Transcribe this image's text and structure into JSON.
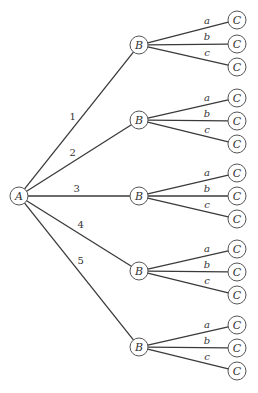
{
  "root": {
    "label": "A",
    "x": 19,
    "y": 196
  },
  "node_radius": 9,
  "level1": {
    "x": 139,
    "nodes": [
      {
        "label": "B",
        "edge_label": "1",
        "y": 45,
        "children_y": [
          20,
          44,
          67
        ]
      },
      {
        "label": "B",
        "edge_label": "2",
        "y": 120,
        "children_y": [
          98,
          121,
          144
        ]
      },
      {
        "label": "B",
        "edge_label": "3",
        "y": 196,
        "children_y": [
          173,
          196,
          219
        ]
      },
      {
        "label": "B",
        "edge_label": "4",
        "y": 271,
        "children_y": [
          249,
          272,
          295
        ]
      },
      {
        "label": "B",
        "edge_label": "5",
        "y": 347,
        "children_y": [
          325,
          348,
          371
        ]
      }
    ]
  },
  "level2": {
    "x": 237,
    "label": "C",
    "edge_labels": [
      "a",
      "b",
      "c"
    ]
  },
  "colors": {
    "edge": "#3a3a3a",
    "node_stroke": "#555555",
    "text": "#333333"
  }
}
